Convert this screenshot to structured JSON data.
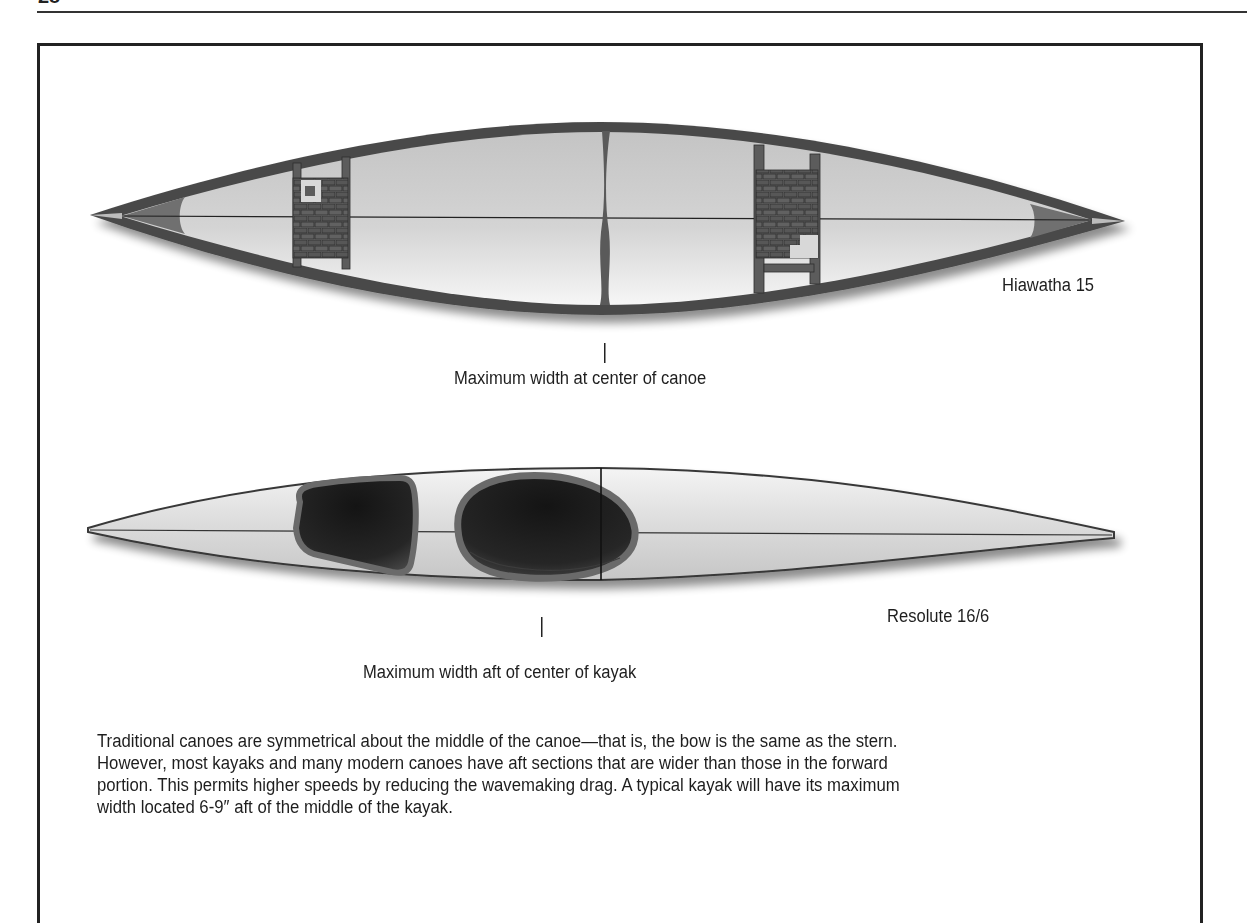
{
  "page": {
    "number": "28"
  },
  "figure": {
    "canoe": {
      "name": "Hiawatha 15",
      "annotation": "Maximum width at center of canoe"
    },
    "kayak": {
      "name": "Resolute 16/6",
      "annotation": "Maximum width aft of center of kayak"
    },
    "caption_lines": [
      "Traditional canoes are symmetrical about the middle of the canoe—that is, the bow is the same as the stern.",
      "However, most kayaks and many modern canoes have aft sections that are wider than those in the forward",
      "portion. This permits higher speeds by reducing the wavemaking drag. A typical kayak will have its maximum",
      "width located 6-9″ aft of the middle of the kayak."
    ]
  },
  "colors": {
    "hull_outline": "#3c3c3c",
    "hull_fill_light": "#f2f2f2",
    "hull_fill_dark": "#b9b9b9",
    "gunwale": "#555555",
    "seat_weave": "#5a5a5a",
    "cockpit": "#1b1b1b",
    "cockpit_rim": "#6a6a6a",
    "text": "#1e1e1e"
  }
}
